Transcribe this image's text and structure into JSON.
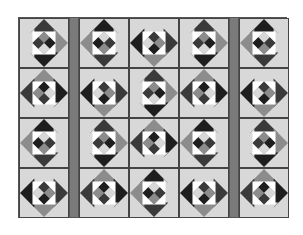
{
  "quilt": {
    "rows": 4,
    "columns": [
      {
        "type": "blocks"
      },
      {
        "type": "sash"
      },
      {
        "type": "blocks"
      },
      {
        "type": "blocks"
      },
      {
        "type": "blocks"
      },
      {
        "type": "sash"
      },
      {
        "type": "blocks"
      }
    ],
    "colors": {
      "background": "#e6e6e6",
      "light": "#d8d8d8",
      "mid": "#8c8c8c",
      "dark": "#3a3a3a",
      "darkest": "#1e1e1e",
      "white": "#ffffff",
      "sash": "#7a7a7a",
      "border": "#444444"
    }
  }
}
